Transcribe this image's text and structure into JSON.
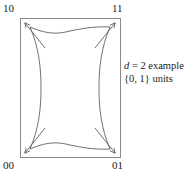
{
  "figure": {
    "kind": "geometric-diagram",
    "background_color": "#ffffff",
    "stroke_color": "#7a7a7a",
    "text_color": "#1a1a1a"
  },
  "corner_labels": {
    "top_left": "10",
    "top_right": "11",
    "bottom_left": "00",
    "bottom_right": "01"
  },
  "annotation": {
    "line_1_var": "d",
    "line_1_rest": " = 2 example",
    "line_2": "{0, 1} units"
  },
  "chart_data": {
    "type": "line",
    "title": "",
    "xlabel": "",
    "ylabel": "",
    "grid": false,
    "legend_position": "none",
    "bounding_box": {
      "x_min": 20,
      "y_min": 18,
      "x_max": 120,
      "y_max": 157,
      "stroke": "#8a8a8a"
    },
    "curve": {
      "name": "pillow-curve",
      "closed": true,
      "description": "closed curve bulging outward at left and right mid-edges and concave inward at top and bottom mid-edges, with cusps near the four corners",
      "path": "M 30,27 C 50,36 62,33 70,31 C 80,29 94,26 110,27 C 101,48 99,68 99,88 C 99,108 101,128 110,149 C 94,150 80,147 70,145 C 62,143 50,140 30,149 C 39,128 41,108 41,88 C 41,68 39,48 30,27 Z"
    },
    "arrows": [
      {
        "name": "arrow-top-left",
        "from": [
          45,
          48
        ],
        "to": [
          25,
          23
        ],
        "direction": "up-left"
      },
      {
        "name": "arrow-top-right",
        "from": [
          95,
          48
        ],
        "to": [
          115,
          23
        ],
        "direction": "up-right"
      },
      {
        "name": "arrow-bottom-left",
        "from": [
          45,
          128
        ],
        "to": [
          25,
          153
        ],
        "direction": "down-left"
      },
      {
        "name": "arrow-bottom-right",
        "from": [
          95,
          128
        ],
        "to": [
          115,
          153
        ],
        "direction": "down-right"
      }
    ]
  }
}
